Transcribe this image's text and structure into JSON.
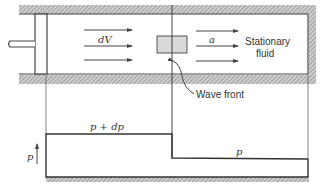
{
  "figure": {
    "top": {
      "piston_side_label": "dV",
      "fluid_side_label": "a",
      "stationary_label_line1": "Stationary",
      "stationary_label_line2": "fluid",
      "wave_front_label": "Wave front"
    },
    "bottom": {
      "axis_label": "p",
      "high_pressure_label": "p + dp",
      "low_pressure_label": "p"
    },
    "colors": {
      "line": "#444444",
      "hatch": "#9a9a9a",
      "wave_box": "#d9d9d9"
    }
  }
}
